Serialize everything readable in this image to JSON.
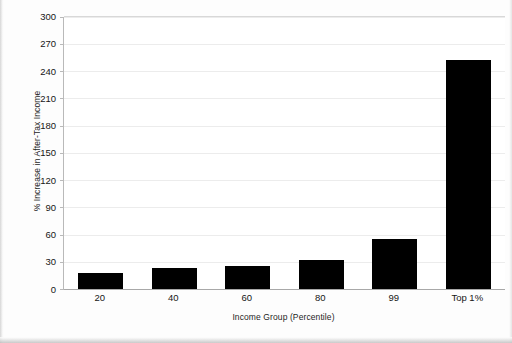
{
  "chart_data": {
    "type": "bar",
    "title": "",
    "categories": [
      "20",
      "40",
      "60",
      "80",
      "99",
      "Top 1%"
    ],
    "values": [
      18,
      23,
      26,
      32,
      55,
      252
    ],
    "series": [
      {
        "name": "% Increase in After-Tax Income",
        "values": [
          18,
          23,
          26,
          32,
          55,
          252
        ]
      }
    ],
    "xlabel": "Income Group (Percentile)",
    "ylabel": "% Increase in After-Tax Income",
    "ylim": [
      0,
      300
    ],
    "ytick_step": 30,
    "yticks": [
      "300",
      "270",
      "240",
      "210",
      "180",
      "150",
      "120",
      "90",
      "60",
      "30",
      "0"
    ],
    "ytick_values": [
      300,
      270,
      240,
      210,
      180,
      150,
      120,
      90,
      60,
      30,
      0
    ],
    "grid": true,
    "grid_axis": "y",
    "legend": false,
    "legend_position": "none",
    "bar_color": "#000000",
    "plot_background": "#ffffff",
    "axis_color": "#b9b9b9"
  }
}
